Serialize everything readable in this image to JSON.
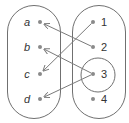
{
  "diagram": {
    "type": "mapping-diagram",
    "domain_set": {
      "name": "left-set",
      "elements": [
        "a",
        "b",
        "c",
        "d"
      ]
    },
    "codomain_set": {
      "name": "right-set",
      "elements": [
        "1",
        "2",
        "3",
        "4"
      ]
    },
    "arrows": [
      {
        "from": "1",
        "to": "c"
      },
      {
        "from": "2",
        "to": "a"
      },
      {
        "from": "3",
        "to": "b"
      },
      {
        "from": "3",
        "to": "d"
      }
    ],
    "highlighted_element": "3",
    "colors": {
      "outline": "#707070",
      "dot": "#8a8a8a",
      "arrow": "#7a7a7a",
      "text": "#333333"
    }
  }
}
